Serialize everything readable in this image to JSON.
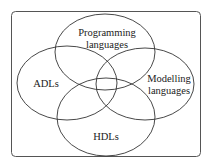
{
  "diagram": {
    "type": "venn",
    "sets": [
      {
        "id": "programming",
        "lines": [
          "Programming",
          "languages"
        ]
      },
      {
        "id": "adls",
        "lines": [
          "ADLs"
        ]
      },
      {
        "id": "modelling",
        "lines": [
          "Modelling",
          "languages"
        ]
      },
      {
        "id": "hdls",
        "lines": [
          "HDLs"
        ]
      }
    ]
  },
  "colors": {
    "stroke": "#333333",
    "frame": "#555555",
    "background": "#ffffff",
    "text": "#222222"
  }
}
